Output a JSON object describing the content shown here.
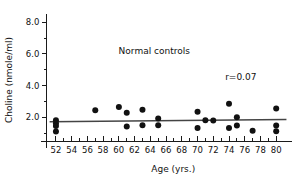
{
  "chart_data": {
    "type": "scatter",
    "title": "",
    "annotations": [
      {
        "text": "Normal controls",
        "x": 64.5,
        "y": 6.0
      },
      {
        "text": "r=0.07",
        "x": 75.5,
        "y": 4.35
      }
    ],
    "xlabel": "Age (yrs.)",
    "ylabel": "Choline (nmole/ml)",
    "xlim": [
      50.8,
      81.5
    ],
    "ylim": [
      0.0,
      9.0
    ],
    "xticks": [
      52,
      54,
      56,
      58,
      60,
      62,
      64,
      66,
      68,
      70,
      72,
      74,
      76,
      78,
      80
    ],
    "xtick_labels": [
      "52",
      "54",
      "56",
      "58",
      "60",
      "62",
      "64",
      "66",
      "68",
      "70",
      "72",
      "74",
      "76",
      "78",
      "80"
    ],
    "yticks": [
      2.0,
      4.0,
      6.0,
      8.0
    ],
    "ytick_labels": [
      "2.0",
      "4.0",
      "6.0",
      "8.0"
    ],
    "yticks_minor": [
      1.0,
      3.0,
      5.0,
      7.0
    ],
    "grid": false,
    "legend": false,
    "points": [
      {
        "x": 52.0,
        "y": 1.82
      },
      {
        "x": 52.0,
        "y": 1.62
      },
      {
        "x": 52.0,
        "y": 1.45
      },
      {
        "x": 52.0,
        "y": 1.1
      },
      {
        "x": 57.0,
        "y": 2.45
      },
      {
        "x": 60.0,
        "y": 2.65
      },
      {
        "x": 61.0,
        "y": 2.28
      },
      {
        "x": 61.0,
        "y": 1.42
      },
      {
        "x": 63.0,
        "y": 2.48
      },
      {
        "x": 63.0,
        "y": 1.5
      },
      {
        "x": 65.0,
        "y": 1.92
      },
      {
        "x": 65.0,
        "y": 1.5
      },
      {
        "x": 70.0,
        "y": 2.35
      },
      {
        "x": 70.0,
        "y": 1.32
      },
      {
        "x": 71.0,
        "y": 1.82
      },
      {
        "x": 72.0,
        "y": 1.8
      },
      {
        "x": 74.0,
        "y": 2.85
      },
      {
        "x": 74.0,
        "y": 1.32
      },
      {
        "x": 75.0,
        "y": 2.0
      },
      {
        "x": 75.0,
        "y": 1.48
      },
      {
        "x": 77.0,
        "y": 1.15
      },
      {
        "x": 80.0,
        "y": 2.55
      },
      {
        "x": 80.0,
        "y": 1.48
      },
      {
        "x": 80.0,
        "y": 1.12
      }
    ],
    "regression_line": {
      "x_start": 51.2,
      "y_start": 1.72,
      "x_end": 81.3,
      "y_end": 1.86,
      "r": 0.07
    },
    "marker_radius_px": 3.0,
    "colors": {
      "marker": "#111111",
      "axis": "#1a1a1a",
      "regression": "#444444",
      "background": "#ffffff"
    }
  }
}
